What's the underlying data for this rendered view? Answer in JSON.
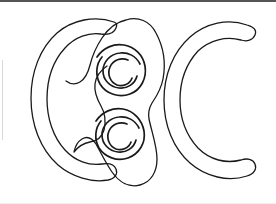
{
  "image": {
    "title": "Line drawing of two crescents flanking a double-spiral peanut shape",
    "width": 276,
    "height": 204,
    "background_color": "#ffffff",
    "stroke_color": "#1a1a1a",
    "top_border_color": "#555555",
    "left_border_color": "#d8d8d8",
    "bottom_border_color": "#f0f0f0"
  },
  "shapes": {
    "left_crescent": {
      "name": "left-crescent",
      "description": "thick crescent outline opening toward the right",
      "stroke_width": 1.3
    },
    "center_blob": {
      "name": "center-peanut-blob",
      "description": "figure-eight peanut outline with a waist notch on the left side",
      "stroke_width": 1.3
    },
    "upper_spiral": {
      "name": "upper-spiral",
      "description": "broken concentric spiral with three arc rings",
      "center_x": 117,
      "center_y": 69,
      "stroke_width": 1.7
    },
    "lower_spiral": {
      "name": "lower-spiral",
      "description": "broken concentric spiral with three arc rings",
      "center_x": 116,
      "center_y": 133,
      "stroke_width": 1.7
    },
    "right_crescent": {
      "name": "right-crescent",
      "description": "thick crescent outline opening toward the right",
      "stroke_width": 1.3
    }
  }
}
